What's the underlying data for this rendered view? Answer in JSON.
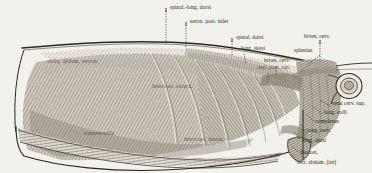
{
  "figure": {
    "kind": "anatomical-engraving",
    "background_color": "#f3f1eb",
    "ink_color": "#3a342c",
    "label_color": "#241f1a"
  },
  "labels": {
    "spinal_long_dorsi": "spinal.-long. dorsi",
    "serrat_post_infer": "serrat. post. infer",
    "spinal_dorsi": "spinal. dorsi",
    "long_dorsi_top": "long. dorsi",
    "biven_cerv_mid": "biven. cerv.",
    "serr_post_sup": "serr. post. sup.",
    "biven_cerv_top": "biven. cerv.",
    "splenius": "splenius",
    "obliq_abdom_extern": "obliq. abdom. extern.",
    "intercost_extern": "intercost. extern.",
    "transversalis": "transversalis",
    "intercost_intern": "intercost. intern.",
    "vena_cerv_sup": "vena cerv. sup.",
    "long_colli": "long. colli",
    "complexus": "complexus",
    "long_cerv": "long. cerv.",
    "long_dorsi_low": "long. dorsi",
    "iliocost": "iliocost.",
    "rect_abdom_int": "rect. abdom. (int)"
  },
  "icons": {
    "vessel_cross_section": "oval-ring-icon"
  }
}
